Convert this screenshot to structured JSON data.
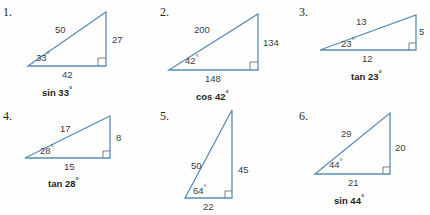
{
  "page": {
    "background_color": "#fefefe",
    "stroke_color": "#5b8db8",
    "text_color": "#3d3d3d",
    "label_color": "#1e1e1e"
  },
  "problems": [
    {
      "number": "1.",
      "hypotenuse": "50",
      "opposite": "27",
      "adjacent": "42",
      "angle": "33",
      "degree_symbol": "°",
      "trig_function": "sin",
      "trig_label": "sin 33",
      "right_angle_marker": "right-angle-square"
    },
    {
      "number": "2.",
      "hypotenuse": "200",
      "opposite": "134",
      "adjacent": "148",
      "angle": "42",
      "degree_symbol": "°",
      "trig_function": "cos",
      "trig_label": "cos 42",
      "right_angle_marker": "right-angle-square"
    },
    {
      "number": "3.",
      "hypotenuse": "13",
      "opposite": "5",
      "adjacent": "12",
      "angle": "23",
      "degree_symbol": "°",
      "trig_function": "tan",
      "trig_label": "tan 23",
      "right_angle_marker": "right-angle-square"
    },
    {
      "number": "4.",
      "hypotenuse": "17",
      "opposite": "8",
      "adjacent": "15",
      "angle": "28",
      "degree_symbol": "°",
      "trig_function": "tan",
      "trig_label": "tan 28",
      "right_angle_marker": "right-angle-square"
    },
    {
      "number": "5.",
      "hypotenuse": "50",
      "opposite": "45",
      "adjacent": "22",
      "angle": "64",
      "degree_symbol": "°",
      "trig_function": "",
      "trig_label": "",
      "right_angle_marker": "right-angle-square"
    },
    {
      "number": "6.",
      "hypotenuse": "29",
      "opposite": "20",
      "adjacent": "21",
      "angle": "44",
      "degree_symbol": "°",
      "trig_function": "sin",
      "trig_label": "sin 44",
      "right_angle_marker": "right-angle-square"
    }
  ]
}
